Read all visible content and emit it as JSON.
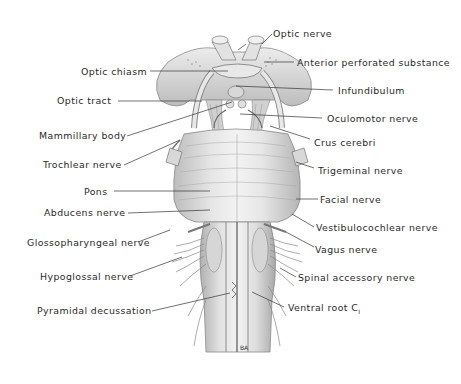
{
  "diagram": {
    "type": "anatomical illustration",
    "labels_left": [
      {
        "id": "optic_chiasm",
        "text": "Optic chiasm"
      },
      {
        "id": "optic_tract",
        "text": "Optic tract"
      },
      {
        "id": "mammillary_body",
        "text": "Mammillary body"
      },
      {
        "id": "trochlear_nerve",
        "text": "Trochlear nerve"
      },
      {
        "id": "pons",
        "text": "Pons"
      },
      {
        "id": "abducens_nerve",
        "text": "Abducens nerve"
      },
      {
        "id": "glossopharyngeal_nerve",
        "text": "Glossopharyngeal nerve"
      },
      {
        "id": "hypoglossal_nerve",
        "text": "Hypoglossal nerve"
      },
      {
        "id": "pyramidal_decussation",
        "text": "Pyramidal decussation"
      }
    ],
    "labels_right": [
      {
        "id": "optic_nerve",
        "text": "Optic nerve"
      },
      {
        "id": "anterior_perforated_substance",
        "text": "Anterior perforated substance"
      },
      {
        "id": "infundibulum",
        "text": "Infundibulum"
      },
      {
        "id": "oculomotor_nerve",
        "text": "Oculomotor nerve"
      },
      {
        "id": "crus_cerebri",
        "text": "Crus cerebri"
      },
      {
        "id": "trigeminal_nerve",
        "text": "Trigeminal nerve"
      },
      {
        "id": "facial_nerve",
        "text": "Facial nerve"
      },
      {
        "id": "vestibulocochlear_nerve",
        "text": "Vestibulocochlear nerve"
      },
      {
        "id": "vagus_nerve",
        "text": "Vagus nerve"
      },
      {
        "id": "spinal_accessory_nerve",
        "text": "Spinal accessory nerve"
      },
      {
        "id": "ventral_root_c1",
        "text": "Ventral root C",
        "subscript": "I"
      }
    ],
    "signature": "BA",
    "colors": {
      "line": "#333333",
      "text": "#2a2a2a",
      "tissue_light": "#e8e8e8",
      "tissue_mid": "#c4c4c4",
      "tissue_dark": "#8a8a8a"
    }
  }
}
